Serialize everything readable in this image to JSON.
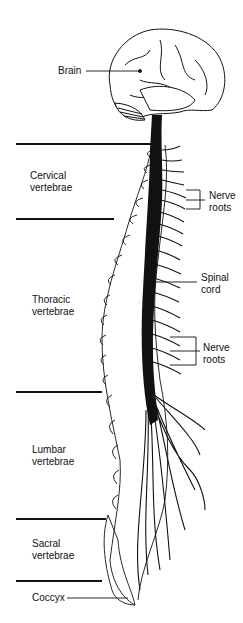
{
  "diagram": {
    "labels": {
      "brain": "Brain",
      "cervical_1": "Cervical",
      "cervical_2": "vertebrae",
      "thoracic_1": "Thoracic",
      "thoracic_2": "vertebrae",
      "lumbar_1": "Lumbar",
      "lumbar_2": "vertebrae",
      "sacral_1": "Sacral",
      "sacral_2": "vertebrae",
      "coccyx": "Coccyx",
      "nerve_roots_upper_1": "Nerve",
      "nerve_roots_upper_2": "roots",
      "spinal_cord_1": "Spinal",
      "spinal_cord_2": "cord",
      "nerve_roots_lower_1": "Nerve",
      "nerve_roots_lower_2": "roots"
    },
    "colors": {
      "ink": "#111111",
      "background": "#ffffff"
    }
  }
}
